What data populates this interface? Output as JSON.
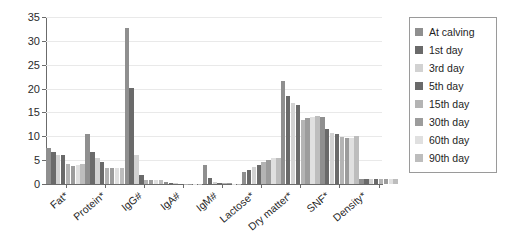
{
  "chart_data": {
    "type": "bar",
    "title": "",
    "subtitle": "",
    "xlabel": "",
    "ylabel": "",
    "ylim": [
      0,
      35
    ],
    "ytick_labels": [
      "0",
      "5",
      "10",
      "15",
      "20",
      "25",
      "30",
      "35"
    ],
    "ytick_values": [
      0,
      5,
      10,
      15,
      20,
      25,
      30,
      35
    ],
    "grid": true,
    "grid_axis": "y",
    "legend_position": "right",
    "categories": [
      "Fat*",
      "Protein*",
      "IgG#",
      "IgA#",
      "IgM#",
      "Lactose*",
      "Dry matter*",
      "SNF*",
      "Density*"
    ],
    "series": [
      {
        "name": "At calving",
        "color": "#8f8f8f",
        "values": [
          7.5,
          10.4,
          32.8,
          0.45,
          3.9,
          2.5,
          21.6,
          14.0,
          1.05
        ]
      },
      {
        "name": "1st day",
        "color": "#6a6a6a",
        "values": [
          6.7,
          6.8,
          20.1,
          0.3,
          1.2,
          3.0,
          18.4,
          11.6,
          1.03
        ]
      },
      {
        "name": "3rd day",
        "color": "#d2d2d2",
        "values": [
          6.0,
          5.5,
          6.0,
          0.14,
          0.35,
          3.6,
          17.0,
          10.6,
          1.03
        ]
      },
      {
        "name": "5th day",
        "color": "#6a6a6a",
        "values": [
          6.0,
          4.7,
          1.8,
          0.1,
          0.25,
          4.0,
          16.6,
          10.4,
          1.02
        ]
      },
      {
        "name": "15th day",
        "color": "#b4b4b4",
        "values": [
          4.1,
          3.4,
          0.9,
          0.08,
          0.15,
          4.6,
          13.5,
          9.8,
          1.02
        ]
      },
      {
        "name": "30th day",
        "color": "#9c9c9c",
        "values": [
          3.7,
          3.3,
          0.85,
          0.07,
          0.12,
          5.0,
          13.8,
          9.7,
          1.02
        ]
      },
      {
        "name": "60th day",
        "color": "#e0e0e0",
        "values": [
          3.9,
          3.3,
          0.8,
          0.06,
          0.1,
          5.4,
          14.0,
          9.7,
          1.02
        ]
      },
      {
        "name": "90th day",
        "color": "#bdbdbd",
        "values": [
          4.1,
          3.3,
          0.8,
          0.06,
          0.1,
          5.4,
          14.3,
          10.1,
          1.02
        ]
      }
    ]
  },
  "colors": {
    "axis": "#6b6b6b",
    "grid": "#e9e9e9",
    "text": "#1e1e1e",
    "legend_border": "#9a9a9a",
    "background": "#ffffff"
  }
}
